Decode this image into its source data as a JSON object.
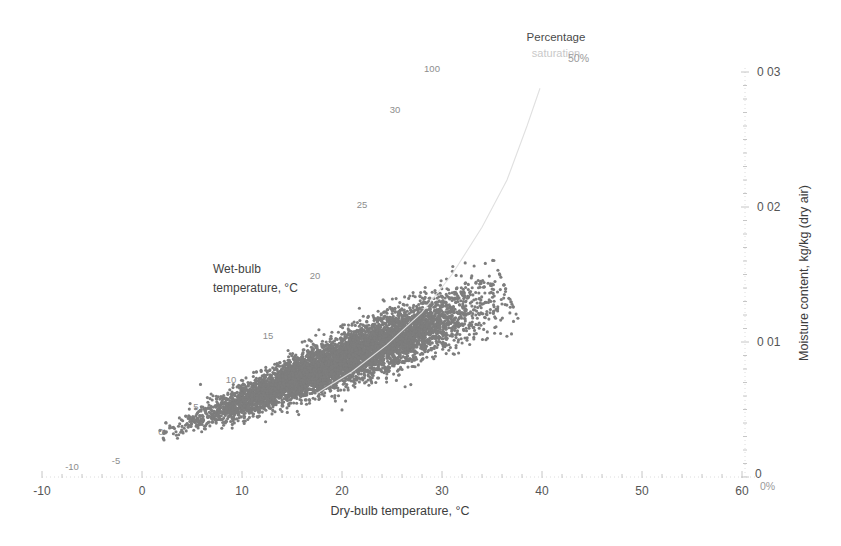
{
  "chart_data": {
    "type": "scatter",
    "title": "",
    "xlabel": "Dry-bulb temperature, °C",
    "ylabel": "Moisture content, kg/kg (dry air)",
    "xlim": [
      -10,
      60
    ],
    "ylim": [
      0,
      0.03
    ],
    "grid": false,
    "legend": "none",
    "x_ticks": [
      "-10",
      "0",
      "10",
      "20",
      "30",
      "40",
      "50",
      "60"
    ],
    "x_tick_values": [
      -10,
      0,
      10,
      20,
      30,
      40,
      50,
      60
    ],
    "y_ticks": [
      "0",
      "0 01",
      "0 02",
      "0 03"
    ],
    "y_tick_values": [
      0,
      0.01,
      0.02,
      0.03
    ],
    "y_axis_side": "right",
    "marker_color": "#7d7d7d",
    "marker_size": 3,
    "point_count_approx": 8760,
    "series": [
      {
        "name": "Hourly air state points",
        "description": "Dense elongated cloud of dry-bulb temperature vs moisture content observations",
        "x_range": [
          2.0,
          37.0
        ],
        "y_range": [
          0.003,
          0.0145
        ],
        "cloud_axis_start": [
          2.0,
          0.0031
        ],
        "cloud_axis_end": [
          36.5,
          0.0137
        ],
        "spread_perpendicular": 0.0018
      }
    ],
    "annotations": [
      {
        "name": "wet-bulb-caption-line-1",
        "text": "Wet-bulb",
        "x": 4.0,
        "y": 0.0196
      },
      {
        "name": "wet-bulb-caption-line-2",
        "text": "temperature, °C",
        "x": 4.0,
        "y": 0.0183
      },
      {
        "name": "percentage-saturation-line-1",
        "text": "Percentage",
        "x": 33.8,
        "y": 0.0307
      },
      {
        "name": "percentage-saturation-line-2",
        "text": "saturation",
        "x": 33.8,
        "y": 0.0294
      },
      {
        "name": "percent-50-label",
        "text": "50%",
        "x": 36.2,
        "y": 0.0285
      },
      {
        "name": "percent-0-label",
        "text": "0%",
        "x": 60.3,
        "y": -0.0005
      },
      {
        "name": "percent-100-label",
        "text": "100",
        "x": 25.5,
        "y": 0.0295
      }
    ],
    "wet_bulb_labels": [
      {
        "label": "-10",
        "x": -7.0,
        "y": 0.0005
      },
      {
        "label": "-5",
        "x": -2.6,
        "y": 0.001
      },
      {
        "label": "0",
        "x": 1.9,
        "y": 0.0031
      },
      {
        "label": "5",
        "x": 5.4,
        "y": 0.005
      },
      {
        "label": "10",
        "x": 8.9,
        "y": 0.007
      },
      {
        "label": "15",
        "x": 12.6,
        "y": 0.0102
      },
      {
        "label": "20",
        "x": 17.3,
        "y": 0.0147
      },
      {
        "label": "25",
        "x": 22.0,
        "y": 0.0199
      },
      {
        "label": "30",
        "x": 25.3,
        "y": 0.027
      },
      {
        "label": "100",
        "x": 29.0,
        "y": 0.03
      }
    ],
    "saturation_curves": [
      {
        "name": "50% saturation line",
        "percent": 50,
        "points": [
          [
            17.5,
            0.0062
          ],
          [
            21.0,
            0.0078
          ],
          [
            24.5,
            0.0098
          ],
          [
            28.0,
            0.0122
          ],
          [
            31.0,
            0.015
          ],
          [
            34.0,
            0.0185
          ],
          [
            36.5,
            0.022
          ],
          [
            38.5,
            0.026
          ],
          [
            39.8,
            0.0288
          ]
        ]
      }
    ]
  },
  "axes": {
    "x_axis_title": "Dry-bulb temperature, °C",
    "y_axis_title": "Moisture content, kg/kg (dry air)"
  },
  "colors": {
    "marker": "#7d7d7d",
    "axis": "#d8d8d8",
    "text": "#4a4a4a",
    "faint_text": "#9a9a9a",
    "curve": "#e0e0e0",
    "background": "#ffffff"
  }
}
